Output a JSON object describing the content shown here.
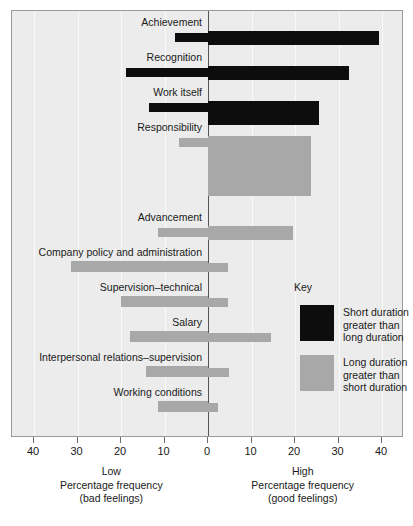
{
  "chart_data": {
    "type": "bar",
    "orientation": "horizontal-diverging",
    "title": "",
    "subtitle": "",
    "xlabel_left": "Low\nPercentage frequency\n(bad feelings)",
    "xlabel_right": "High\nPercentage frequency\n(good feelings)",
    "ylabel": "",
    "grid": true,
    "legend_position": "inside-right",
    "xlim": [
      -44,
      44
    ],
    "xticks": [
      -40,
      -30,
      -20,
      -10,
      0,
      10,
      20,
      30,
      40
    ],
    "xtick_labels": [
      "40",
      "30",
      "20",
      "10",
      "0",
      "10",
      "20",
      "30",
      "40"
    ],
    "categories": [
      "Achievement",
      "Recognition",
      "Work itself",
      "Responsibility",
      "Advancement",
      "Company policy and administration",
      "Supervision–technical",
      "Salary",
      "Interpersonal relations–supervision",
      "Working conditions"
    ],
    "series": [
      {
        "name": "Short duration greater than long duration",
        "color": "#0d0d0d",
        "left_values": [
          7.6,
          18.9,
          13.6,
          0,
          0,
          0,
          0,
          0,
          0,
          0
        ],
        "right_values": [
          39.3,
          32.4,
          25.5,
          0,
          0,
          0,
          0,
          0,
          0,
          0
        ]
      },
      {
        "name": "Long duration greater than short duration",
        "color": "#a8a8a8",
        "left_values": [
          0,
          0,
          0,
          6.7,
          11.5,
          31.5,
          20.0,
          18.0,
          14.3,
          11.5
        ],
        "right_values": [
          0,
          0,
          0,
          23.7,
          19.5,
          4.6,
          4.6,
          14.5,
          4.8,
          2.3
        ]
      }
    ],
    "rows": [
      {
        "label": "Achievement",
        "color": "black",
        "left": 7.6,
        "right": 39.3,
        "emphasis": "right"
      },
      {
        "label": "Recognition",
        "color": "black",
        "left": 18.9,
        "right": 32.4,
        "emphasis": "both"
      },
      {
        "label": "Work itself",
        "color": "black",
        "left": 13.6,
        "right": 25.5,
        "emphasis": "right"
      },
      {
        "label": "Responsibility",
        "color": "gray",
        "left": 6.7,
        "right": 23.7,
        "emphasis": "right"
      },
      {
        "label": "Advancement",
        "color": "gray",
        "left": 11.5,
        "right": 19.5,
        "emphasis": "right"
      },
      {
        "label": "Company policy and administration",
        "color": "gray",
        "left": 31.5,
        "right": 4.6,
        "emphasis": "left"
      },
      {
        "label": "Supervision–technical",
        "color": "gray",
        "left": 20.0,
        "right": 4.6,
        "emphasis": "left"
      },
      {
        "label": "Salary",
        "color": "gray",
        "left": 18.0,
        "right": 14.5,
        "emphasis": "left"
      },
      {
        "label": "Interpersonal relations–supervision",
        "color": "gray",
        "left": 14.3,
        "right": 4.8,
        "emphasis": "left"
      },
      {
        "label": "Working conditions",
        "color": "gray",
        "left": 11.5,
        "right": 2.3,
        "emphasis": "left"
      }
    ]
  },
  "axis": {
    "ticks": [
      {
        "label": "40",
        "value": -40
      },
      {
        "label": "30",
        "value": -30
      },
      {
        "label": "20",
        "value": -20
      },
      {
        "label": "10",
        "value": -10
      },
      {
        "label": "0",
        "value": 0
      },
      {
        "label": "10",
        "value": 10
      },
      {
        "label": "20",
        "value": 20
      },
      {
        "label": "30",
        "value": 30
      },
      {
        "label": "40",
        "value": 40
      }
    ],
    "left_caption": {
      "line1": "Low",
      "line2": "Percentage frequency",
      "line3": "(bad feelings)"
    },
    "right_caption": {
      "line1": "High",
      "line2": "Percentage frequency",
      "line3": "(good feelings)"
    }
  },
  "legend": {
    "title": "Key",
    "entries": [
      {
        "swatch": "black",
        "line1": "Short duration",
        "line2": "greater than",
        "line3": "long duration"
      },
      {
        "swatch": "gray",
        "line1": "Long duration",
        "line2": "greater than",
        "line3": "short duration"
      }
    ]
  },
  "colors": {
    "panel_background": "#ececec",
    "panel_border": "#9a9a9a",
    "gridline": "#fafafa",
    "zeroline": "#555555",
    "bar_black": "#0d0d0d",
    "bar_gray": "#a8a8a8",
    "text": "#1a1a1a"
  }
}
